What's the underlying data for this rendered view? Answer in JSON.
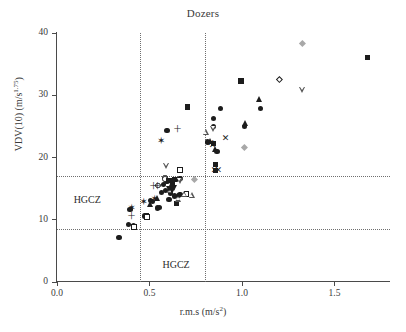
{
  "chart_data": {
    "type": "scatter",
    "title": "Dozers",
    "xlabel_main": "r.m.s (m/s",
    "xlabel_sup": "2",
    "xlabel_tail": ")",
    "ylabel_main": "VDV(10) (m/s",
    "ylabel_sup": "1.75",
    "ylabel_tail": ")",
    "xlim": [
      0.0,
      1.8
    ],
    "ylim": [
      0,
      40
    ],
    "xticks": [
      0.0,
      0.5,
      1.0,
      1.5
    ],
    "xtick_labels": [
      "0.0",
      "0.5",
      "1.0",
      "1.5"
    ],
    "yticks": [
      0,
      10,
      20,
      30,
      40
    ],
    "ytick_labels": [
      "0",
      "10",
      "20",
      "30",
      "40"
    ],
    "grid": false,
    "legend": "none",
    "annotations": [
      {
        "text": "HGCZ",
        "x": 0.09,
        "y": 13.0,
        "name": "hgcz-label-left"
      },
      {
        "text": "HGCZ",
        "x": 0.57,
        "y": 2.6,
        "name": "hgcz-label-bottom"
      }
    ],
    "reference_lines": {
      "horizontal": [
        17.0,
        8.5
      ],
      "vertical": [
        0.45,
        0.8
      ]
    },
    "series": [
      {
        "name": "filled-circle",
        "marker": "circle",
        "color": "#1c1c1c",
        "points": [
          [
            0.335,
            7.2
          ],
          [
            0.385,
            9.3
          ],
          [
            0.395,
            11.6
          ],
          [
            0.415,
            9.0
          ],
          [
            0.475,
            10.6
          ],
          [
            0.505,
            13.1
          ],
          [
            0.515,
            12.9
          ],
          [
            0.545,
            11.9
          ],
          [
            0.555,
            12.0
          ],
          [
            0.565,
            14.4
          ],
          [
            0.575,
            15.6
          ],
          [
            0.585,
            14.7
          ],
          [
            0.595,
            16.1
          ],
          [
            0.605,
            13.2
          ],
          [
            0.615,
            14.3
          ],
          [
            0.625,
            15.2
          ],
          [
            0.635,
            13.8
          ],
          [
            0.645,
            16.5
          ],
          [
            0.655,
            13.9
          ],
          [
            0.665,
            14.0
          ],
          [
            0.595,
            24.4
          ],
          [
            0.665,
            16.6
          ],
          [
            0.845,
            26.3
          ],
          [
            0.865,
            20.9
          ],
          [
            0.815,
            22.5
          ],
          [
            0.845,
            25.0
          ],
          [
            0.885,
            27.9
          ],
          [
            1.015,
            25.0
          ],
          [
            1.1,
            27.9
          ]
        ]
      },
      {
        "name": "open-circle",
        "marker": "circle-open",
        "color": "#1c1c1c",
        "points": [
          [
            0.545,
            15.5
          ],
          [
            0.585,
            16.8
          ],
          [
            0.585,
            16.5
          ]
        ]
      },
      {
        "name": "filled-square",
        "marker": "square",
        "color": "#1c1c1c",
        "points": [
          [
            0.485,
            10.7
          ],
          [
            0.605,
            16.3
          ],
          [
            0.625,
            15.9
          ],
          [
            0.635,
            16.4
          ],
          [
            0.645,
            12.6
          ],
          [
            0.705,
            28.1
          ],
          [
            0.845,
            22.3
          ],
          [
            0.855,
            18.9
          ],
          [
            0.855,
            17.9
          ],
          [
            0.995,
            32.3
          ],
          [
            1.68,
            36.0
          ]
        ]
      },
      {
        "name": "open-square",
        "marker": "square-open",
        "color": "#1c1c1c",
        "points": [
          [
            0.415,
            8.8
          ],
          [
            0.485,
            10.4
          ],
          [
            0.665,
            18.0
          ],
          [
            0.7,
            14.2
          ]
        ]
      },
      {
        "name": "filled-triangle-up",
        "marker": "triangle",
        "color": "#1c1c1c",
        "points": [
          [
            0.505,
            12.6
          ],
          [
            0.545,
            13.5
          ],
          [
            0.615,
            15.2
          ],
          [
            0.83,
            22.6
          ],
          [
            0.855,
            21.4
          ],
          [
            1.02,
            25.6
          ],
          [
            1.095,
            29.4
          ]
        ]
      },
      {
        "name": "open-triangle-up",
        "marker": "triangle-open",
        "color": "#555555",
        "points": [
          [
            0.615,
            14.8
          ],
          [
            0.655,
            13.4
          ],
          [
            0.69,
            14.1
          ],
          [
            0.73,
            14.0
          ],
          [
            0.805,
            24.1
          ]
        ]
      },
      {
        "name": "filled-triangle-down",
        "marker": "itriangle",
        "color": "#1c1c1c",
        "points": [
          [
            0.605,
            15.0
          ],
          [
            0.625,
            14.6
          ],
          [
            0.635,
            15.1
          ]
        ]
      },
      {
        "name": "open-triangle-down",
        "marker": "itriangle-open",
        "color": "#555555",
        "points": [
          [
            0.59,
            18.7
          ],
          [
            0.665,
            16.3
          ],
          [
            0.845,
            24.5
          ],
          [
            1.325,
            30.9
          ]
        ]
      },
      {
        "name": "gray-diamond",
        "marker": "diamond-gray",
        "color": "#a8a8a8",
        "points": [
          [
            0.745,
            16.5
          ],
          [
            1.015,
            21.7
          ],
          [
            1.325,
            38.3
          ]
        ]
      },
      {
        "name": "open-diamond",
        "marker": "diamond-open",
        "color": "#1c1c1c",
        "points": [
          [
            1.2,
            32.5
          ]
        ]
      },
      {
        "name": "x-marker",
        "marker": "x",
        "color": "#1c1c1c",
        "points": [
          [
            0.835,
            22.1
          ],
          [
            0.845,
            21.9
          ],
          [
            0.855,
            17.8
          ],
          [
            0.875,
            17.9
          ],
          [
            0.915,
            23.0
          ]
        ]
      },
      {
        "name": "plus-marker",
        "marker": "plus",
        "color": "#1c1c1c",
        "points": [
          [
            0.4,
            10.4
          ],
          [
            0.52,
            15.3
          ],
          [
            0.545,
            15.2
          ],
          [
            0.65,
            24.4
          ]
        ]
      },
      {
        "name": "star-marker",
        "marker": "star",
        "color": "#1c1c1c",
        "points": [
          [
            0.405,
            11.9
          ],
          [
            0.47,
            12.9
          ],
          [
            0.53,
            13.4
          ],
          [
            0.565,
            22.6
          ]
        ]
      }
    ]
  }
}
